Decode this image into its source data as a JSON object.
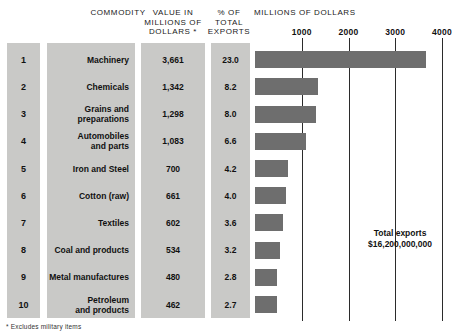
{
  "header": {
    "commodity": "COMMODITY",
    "value": "VALUE IN MILLIONS OF DOLLARS *",
    "percent": "% OF TOTAL EXPORTS",
    "axis_title": "MILLIONS OF DOLLARS"
  },
  "annotation": {
    "line1": "Total exports",
    "line2": "$16,200,000,000"
  },
  "footnote": "* Excludes military items",
  "colors": {
    "bar": "#6e6e6e",
    "panel": "#c9c9c7",
    "gridline": "#2b2b2b",
    "background": "#ffffff"
  },
  "chart_data": {
    "type": "bar",
    "title": "MILLIONS OF DOLLARS",
    "xlabel": "MILLIONS OF DOLLARS",
    "ylabel": "",
    "orientation": "horizontal",
    "xlim": [
      0,
      4000
    ],
    "xticks": [
      1000,
      2000,
      3000,
      4000
    ],
    "xtick_labels": [
      "1000",
      "2000",
      "3000",
      "4000"
    ],
    "grid": true,
    "legend": false,
    "columns": [
      "",
      "COMMODITY",
      "VALUE IN MILLIONS OF DOLLARS *",
      "% OF TOTAL EXPORTS"
    ],
    "categories": [
      "Machinery",
      "Chemicals",
      "Grains and preparations",
      "Automobiles and parts",
      "Iron and Steel",
      "Cotton (raw)",
      "Textiles",
      "Coal and products",
      "Metal manufactures",
      "Petroleum and products"
    ],
    "values": [
      3661,
      1342,
      1298,
      1083,
      700,
      661,
      602,
      534,
      480,
      462
    ],
    "rows": [
      {
        "rank": "1",
        "commodity": "Machinery",
        "commodity_l1": "Machinery",
        "commodity_l2": "",
        "value": "3,661",
        "percent": "23.0",
        "value_num": 3661,
        "percent_num": 23.0
      },
      {
        "rank": "2",
        "commodity": "Chemicals",
        "commodity_l1": "Chemicals",
        "commodity_l2": "",
        "value": "1,342",
        "percent": "8.2",
        "value_num": 1342,
        "percent_num": 8.2
      },
      {
        "rank": "3",
        "commodity": "Grains and preparations",
        "commodity_l1": "Grains and",
        "commodity_l2": "preparations",
        "value": "1,298",
        "percent": "8.0",
        "value_num": 1298,
        "percent_num": 8.0
      },
      {
        "rank": "4",
        "commodity": "Automobiles and parts",
        "commodity_l1": "Automobiles",
        "commodity_l2": "and parts",
        "value": "1,083",
        "percent": "6.6",
        "value_num": 1083,
        "percent_num": 6.6
      },
      {
        "rank": "5",
        "commodity": "Iron and Steel",
        "commodity_l1": "Iron and Steel",
        "commodity_l2": "",
        "value": "700",
        "percent": "4.2",
        "value_num": 700,
        "percent_num": 4.2
      },
      {
        "rank": "6",
        "commodity": "Cotton (raw)",
        "commodity_l1": "Cotton (raw)",
        "commodity_l2": "",
        "value": "661",
        "percent": "4.0",
        "value_num": 661,
        "percent_num": 4.0
      },
      {
        "rank": "7",
        "commodity": "Textiles",
        "commodity_l1": "Textiles",
        "commodity_l2": "",
        "value": "602",
        "percent": "3.6",
        "value_num": 602,
        "percent_num": 3.6
      },
      {
        "rank": "8",
        "commodity": "Coal and products",
        "commodity_l1": "Coal and products",
        "commodity_l2": "",
        "value": "534",
        "percent": "3.2",
        "value_num": 534,
        "percent_num": 3.2
      },
      {
        "rank": "9",
        "commodity": "Metal manufactures",
        "commodity_l1": "Metal manufactures",
        "commodity_l2": "",
        "value": "480",
        "percent": "2.8",
        "value_num": 480,
        "percent_num": 2.8
      },
      {
        "rank": "10",
        "commodity": "Petroleum and products",
        "commodity_l1": "Petroleum",
        "commodity_l2": "and products",
        "value": "462",
        "percent": "2.7",
        "value_num": 462,
        "percent_num": 2.7
      }
    ],
    "annotations": [
      {
        "text": "Total exports $16,200,000,000",
        "x": 2900,
        "y": 8
      }
    ]
  }
}
